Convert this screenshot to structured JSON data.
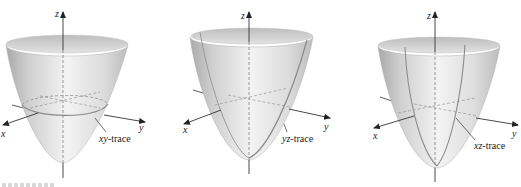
{
  "figure": {
    "panels": [
      {
        "id": "xy",
        "axes": {
          "x": "x",
          "y": "y",
          "z": "z"
        },
        "trace_label_var": "xy",
        "trace_label_suffix": "-trace",
        "trace_label": "xy-trace",
        "trace_type": "horizontal ellipse (intersection with xy-plane)"
      },
      {
        "id": "yz",
        "axes": {
          "x": "x",
          "y": "y",
          "z": "z"
        },
        "trace_label_var": "yz",
        "trace_label_suffix": "-trace",
        "trace_label": "yz-trace",
        "trace_type": "parabola in yz-plane"
      },
      {
        "id": "xz",
        "axes": {
          "x": "x",
          "y": "y",
          "z": "z"
        },
        "trace_label_var": "xz",
        "trace_label_suffix": "-trace",
        "trace_label": "xz-trace",
        "trace_type": "parabola in xz-plane"
      }
    ],
    "colors": {
      "surface_light": "#f4f4f4",
      "surface_mid": "#d9d9d9",
      "surface_dark": "#b4b4b4",
      "rim_inner": "#c8c8c8",
      "axis": "#333333",
      "trace": "#8a8a8a"
    }
  }
}
